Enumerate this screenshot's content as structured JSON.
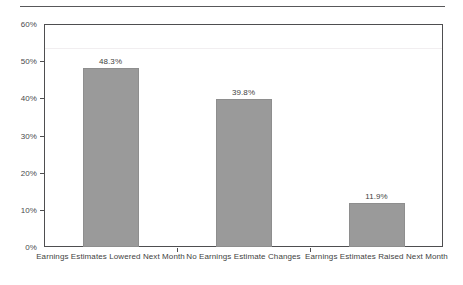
{
  "chart_data": {
    "type": "bar",
    "title": "",
    "subtitle": "",
    "xlabel": "",
    "ylabel": "",
    "categories": [
      "Earnings Estimates Lowered Next Month",
      "No Earnings Estimate Changes",
      "Earnings Estimates Raised Next Month"
    ],
    "values": [
      48.3,
      39.8,
      11.9
    ],
    "value_labels": [
      "48.3%",
      "39.8%",
      "11.9%"
    ],
    "ylim": [
      0,
      60
    ],
    "ytick_values": [
      0,
      10,
      20,
      30,
      40,
      50,
      60
    ],
    "ytick_labels": [
      "0%",
      "10%",
      "20%",
      "30%",
      "40%",
      "50%",
      "60%"
    ],
    "grid": false,
    "legend": null,
    "legend_position": "none",
    "orientation": "vertical",
    "bar_color": "#9a9a9a",
    "bar_edge_color": "#8e8e8e",
    "axis_color": "#4e4e50",
    "text_color": "#3f3f41"
  },
  "figure": {
    "top_rule": true,
    "background": "#ffffff"
  }
}
